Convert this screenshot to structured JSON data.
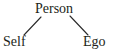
{
  "diagram": {
    "type": "tree",
    "background_color": "#ffffff",
    "text_color": "#231f20",
    "edge_color": "#2b2b2b",
    "root": {
      "label": "Person"
    },
    "children": [
      {
        "label": "Self"
      },
      {
        "label": "Ego"
      }
    ],
    "edges": [
      {
        "from": "Person",
        "to": "Self",
        "x1": 41,
        "y1": 17,
        "x2": 24,
        "y2": 35
      },
      {
        "from": "Person",
        "to": "Ego",
        "x1": 70,
        "y1": 16,
        "x2": 88,
        "y2": 35
      }
    ]
  }
}
